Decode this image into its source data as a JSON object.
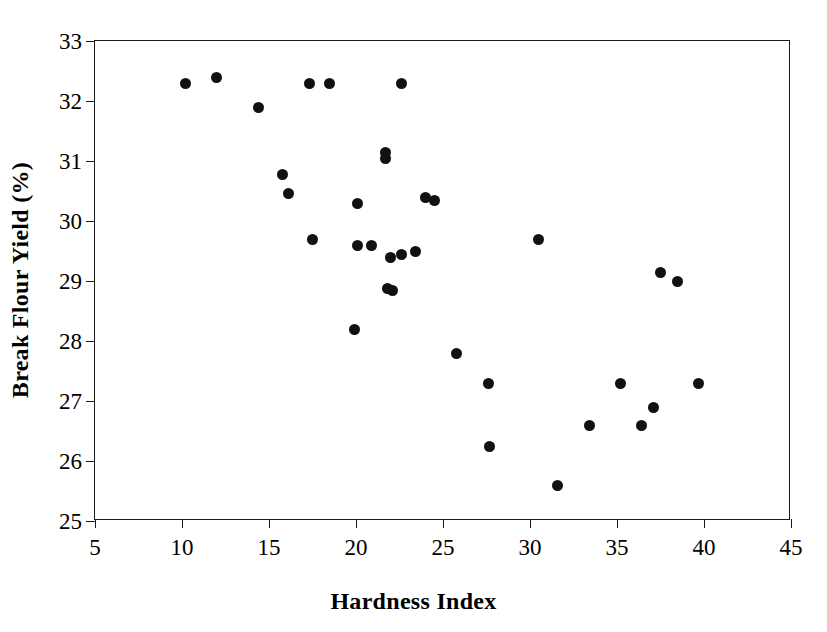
{
  "chart_data": {
    "type": "scatter",
    "title": "",
    "xlabel": "Hardness Index",
    "ylabel": "Break Flour Yield (%)",
    "xlim": [
      5,
      45
    ],
    "ylim": [
      25,
      33
    ],
    "xticks": [
      5,
      10,
      15,
      20,
      25,
      30,
      35,
      40,
      45
    ],
    "yticks": [
      25,
      26,
      27,
      28,
      29,
      30,
      31,
      32,
      33
    ],
    "xtick_labels": [
      "5",
      "10",
      "15",
      "20",
      "25",
      "30",
      "35",
      "40",
      "45"
    ],
    "ytick_labels": [
      "25",
      "26",
      "27",
      "28",
      "29",
      "30",
      "31",
      "32",
      "33"
    ],
    "grid": false,
    "legend": false,
    "marker": {
      "shape": "circle",
      "color": "#111111",
      "size_px": 11
    },
    "series": [
      {
        "name": "Wheat samples",
        "x": [
          10.2,
          12.0,
          14.4,
          15.8,
          16.1,
          17.3,
          18.5,
          22.6,
          21.7,
          21.7,
          20.1,
          17.5,
          20.1,
          20.9,
          22.0,
          22.6,
          23.4,
          24.0,
          24.5,
          21.8,
          22.1,
          19.9,
          25.8,
          27.6,
          27.7,
          30.5,
          31.6,
          33.4,
          35.2,
          36.4,
          37.1,
          37.5,
          38.5,
          39.7
        ],
        "y": [
          32.3,
          32.4,
          31.9,
          30.78,
          30.46,
          32.3,
          32.3,
          32.3,
          31.15,
          31.05,
          30.3,
          29.7,
          29.6,
          29.6,
          29.4,
          29.45,
          29.5,
          30.4,
          30.35,
          28.88,
          28.85,
          28.2,
          27.8,
          27.3,
          26.25,
          29.7,
          25.6,
          26.6,
          27.3,
          26.6,
          26.9,
          29.15,
          29.0,
          27.3
        ]
      }
    ],
    "points": [
      {
        "x": 10.2,
        "y": 32.3
      },
      {
        "x": 12.0,
        "y": 32.4
      },
      {
        "x": 14.4,
        "y": 31.9
      },
      {
        "x": 15.8,
        "y": 30.78
      },
      {
        "x": 16.1,
        "y": 30.46
      },
      {
        "x": 17.3,
        "y": 32.3
      },
      {
        "x": 18.5,
        "y": 32.3
      },
      {
        "x": 22.6,
        "y": 32.3
      },
      {
        "x": 21.7,
        "y": 31.15
      },
      {
        "x": 21.7,
        "y": 31.05
      },
      {
        "x": 20.1,
        "y": 30.3
      },
      {
        "x": 17.5,
        "y": 29.7
      },
      {
        "x": 20.1,
        "y": 29.6
      },
      {
        "x": 20.9,
        "y": 29.6
      },
      {
        "x": 22.0,
        "y": 29.4
      },
      {
        "x": 22.6,
        "y": 29.45
      },
      {
        "x": 23.4,
        "y": 29.5
      },
      {
        "x": 24.0,
        "y": 30.4
      },
      {
        "x": 24.5,
        "y": 30.35
      },
      {
        "x": 21.8,
        "y": 28.88
      },
      {
        "x": 22.1,
        "y": 28.85
      },
      {
        "x": 19.9,
        "y": 28.2
      },
      {
        "x": 25.8,
        "y": 27.8
      },
      {
        "x": 27.6,
        "y": 27.3
      },
      {
        "x": 27.7,
        "y": 26.25
      },
      {
        "x": 30.5,
        "y": 29.7
      },
      {
        "x": 31.6,
        "y": 25.6
      },
      {
        "x": 33.4,
        "y": 26.6
      },
      {
        "x": 35.2,
        "y": 27.3
      },
      {
        "x": 36.4,
        "y": 26.6
      },
      {
        "x": 37.1,
        "y": 26.9
      },
      {
        "x": 37.5,
        "y": 29.15
      },
      {
        "x": 38.5,
        "y": 29.0
      },
      {
        "x": 39.7,
        "y": 27.3
      }
    ]
  },
  "axes": {
    "x_title": "Hardness Index",
    "y_title": "Break Flour Yield (%)"
  }
}
